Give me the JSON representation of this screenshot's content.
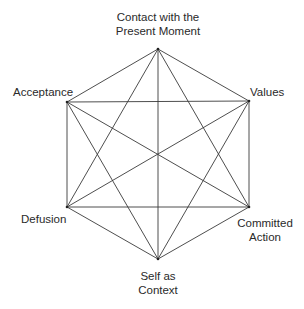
{
  "diagram": {
    "type": "hexaflex",
    "line_color": "#3a3a3a",
    "background": "#ffffff",
    "nodes": [
      {
        "id": "present",
        "label_lines": [
          "Contact with the",
          "Present Moment"
        ],
        "x": 158,
        "y": 49
      },
      {
        "id": "values",
        "label_lines": [
          "Values"
        ],
        "x": 249,
        "y": 101
      },
      {
        "id": "committed",
        "label_lines": [
          "Committed",
          "Action"
        ],
        "x": 249,
        "y": 207
      },
      {
        "id": "self",
        "label_lines": [
          "Self as",
          "Context"
        ],
        "x": 158,
        "y": 259
      },
      {
        "id": "defusion",
        "label_lines": [
          "Defusion"
        ],
        "x": 67,
        "y": 207
      },
      {
        "id": "acceptance",
        "label_lines": [
          "Acceptance"
        ],
        "x": 67,
        "y": 102
      }
    ],
    "edges": "all pairs connected (complete graph K6)"
  }
}
